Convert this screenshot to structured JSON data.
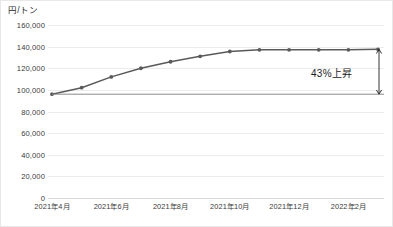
{
  "chart_data": {
    "type": "line",
    "title": "",
    "ylabel": "円/トン",
    "xlabel": "",
    "ylim": [
      0,
      160000
    ],
    "ytick_values": [
      160000,
      140000,
      120000,
      100000,
      80000,
      60000,
      40000,
      20000,
      0
    ],
    "ytick_labels": [
      "160,000",
      "140,000",
      "120,000",
      "100,000",
      "80,000",
      "60,000",
      "40,000",
      "20,000",
      "0"
    ],
    "grid": true,
    "legend": "none",
    "x": [
      "2021年4月",
      "2021年5月",
      "2021年6月",
      "2021年7月",
      "2021年8月",
      "2021年9月",
      "2021年10月",
      "2021年11月",
      "2021年12月",
      "2022年1月",
      "2022年2月",
      "2022年3月"
    ],
    "xtick_labels": [
      "2021年4月",
      "2021年6月",
      "2021年8月",
      "2021年10月",
      "2021年12月",
      "2022年2月"
    ],
    "xtick_indices": [
      0,
      2,
      4,
      6,
      8,
      10
    ],
    "series": [
      {
        "name": "価格",
        "values": [
          96000,
          102000,
          112000,
          120000,
          126000,
          131000,
          135500,
          137000,
          137000,
          137000,
          137000,
          137500
        ],
        "color": "#5a5a5a",
        "marker": "circle"
      }
    ],
    "reference_line": {
      "value": 96000,
      "from_index": 0,
      "to_index": 11,
      "color": "#8a8a8a"
    },
    "annotations": [
      {
        "text": "43%上昇",
        "from_value": 96000,
        "to_value": 137500,
        "at_index": 11,
        "arrow": "double-headed-vertical",
        "color": "#1d1d1d"
      }
    ]
  },
  "caption": ""
}
